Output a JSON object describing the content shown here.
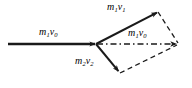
{
  "figure": {
    "background_color": "#ffffff",
    "stroke_color": "#1a1a1a",
    "labels": {
      "incoming_momentum": {
        "symbol": "m",
        "sub1": "1",
        "symbol2": "v",
        "sub2": "0",
        "text": "m1v0"
      },
      "particle1_momentum": {
        "symbol": "m",
        "sub1": "1",
        "symbol2": "v",
        "sub2": "1",
        "text": "m1v1"
      },
      "resultant_momentum": {
        "symbol": "m",
        "sub1": "1",
        "symbol2": "v",
        "sub2": "0",
        "text": "m1v0"
      },
      "particle2_momentum": {
        "symbol": "m",
        "sub1": "2",
        "symbol2": "v",
        "sub2": "2",
        "text": "m2v2"
      }
    },
    "geometry": {
      "vertex": [
        96,
        44
      ],
      "incoming_tail": [
        8,
        44
      ],
      "m1v1_head": [
        158,
        12
      ],
      "m2v2_head": [
        120,
        73
      ],
      "resultant_head": [
        178,
        44
      ]
    }
  }
}
